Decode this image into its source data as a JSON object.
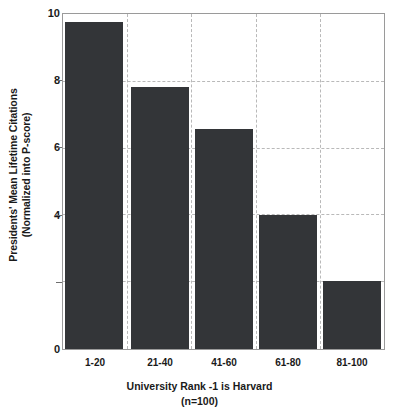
{
  "chart_data": {
    "type": "bar",
    "title": "",
    "categories": [
      "1-20",
      "21-40",
      "41-60",
      "61-80",
      "81-100"
    ],
    "values": [
      9.8,
      7.85,
      6.6,
      4.0,
      2.05
    ],
    "xlabel": "University Rank -1 is Harvard",
    "xlabel_sub": "(n=100)",
    "ylabel": "Presidents' Mean Lifetime Citations",
    "ylabel_sub": "(Normalized into P-score)",
    "ylim": [
      0,
      10
    ],
    "xlim_note": "categorical",
    "y_ticks": [
      0,
      2,
      4,
      6,
      8,
      10
    ],
    "y_tick_labels": [
      "0",
      "",
      "4",
      "6",
      "8",
      "10"
    ],
    "grid": "horizontal and vertical dashed",
    "legend": "none",
    "bar_color": "#333538",
    "grid_color": "#b9b9b9",
    "axis_color": "#9a9a9a",
    "text_color": "#1a1a1a"
  },
  "axes": {
    "y_title_line1": "Presidents' Mean Lifetime Citations",
    "y_title_line2": "(Normalized into P-score)",
    "x_title_line1": "University Rank -1 is Harvard",
    "x_title_line2": "(n=100)",
    "y_labels": {
      "t10": "10",
      "t8": "8",
      "t6": "6",
      "t4": "4",
      "t2": "",
      "t0": "0"
    },
    "x_labels": {
      "c0": "1-20",
      "c1": "21-40",
      "c2": "41-60",
      "c3": "61-80",
      "c4": "81-100"
    }
  }
}
